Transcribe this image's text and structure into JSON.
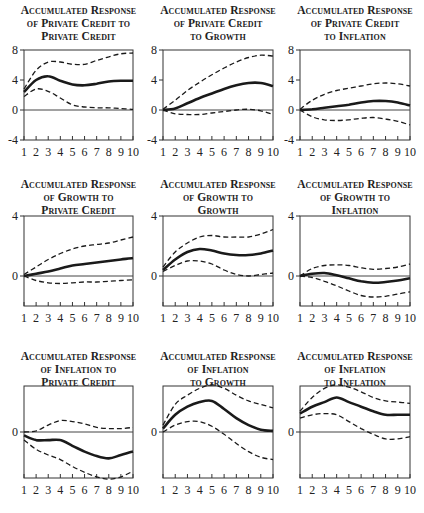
{
  "chart_data": [
    {
      "type": "line",
      "title": "Accumulated Response of Private Credit to Private Credit",
      "title_lines": [
        "Accumulated Response",
        "of Private Credit to",
        "Private Credit"
      ],
      "x": [
        1,
        2,
        3,
        4,
        5,
        6,
        7,
        8,
        9,
        10
      ],
      "xticks": [
        "1",
        "2",
        "3",
        "4",
        "5",
        "6",
        "7",
        "8",
        "9",
        "10"
      ],
      "ylim": [
        -4,
        8
      ],
      "yticks": [
        -4,
        0,
        4,
        8
      ],
      "ytick_labels": [
        "-4",
        "0",
        "4",
        "8"
      ],
      "series": [
        {
          "name": "response",
          "style": "solid",
          "values": [
            2.4,
            4.0,
            4.5,
            3.9,
            3.4,
            3.3,
            3.5,
            3.8,
            3.9,
            3.9
          ]
        },
        {
          "name": "upper band",
          "style": "dashed",
          "values": [
            2.8,
            5.3,
            6.4,
            6.4,
            6.1,
            6.1,
            6.6,
            7.1,
            7.5,
            7.6
          ]
        },
        {
          "name": "lower band",
          "style": "dashed",
          "values": [
            1.8,
            2.8,
            2.5,
            1.6,
            0.7,
            0.4,
            0.3,
            0.3,
            0.2,
            0.1
          ]
        }
      ]
    },
    {
      "type": "line",
      "title": "Accumulated Response of Private Credit to Growth",
      "title_lines": [
        "Accumulated Response",
        "of Private Credit",
        "to Growth"
      ],
      "x": [
        1,
        2,
        3,
        4,
        5,
        6,
        7,
        8,
        9,
        10
      ],
      "xticks": [
        "1",
        "2",
        "3",
        "4",
        "5",
        "6",
        "7",
        "8",
        "9",
        "10"
      ],
      "ylim": [
        -4,
        8
      ],
      "yticks": [
        -4,
        0,
        4,
        8
      ],
      "ytick_labels": [
        "-4",
        "0",
        "4",
        "8"
      ],
      "series": [
        {
          "name": "response",
          "style": "solid",
          "values": [
            0.0,
            0.2,
            0.9,
            1.6,
            2.2,
            2.8,
            3.3,
            3.6,
            3.6,
            3.2
          ]
        },
        {
          "name": "upper band",
          "style": "dashed",
          "values": [
            0.1,
            1.3,
            2.6,
            3.7,
            4.7,
            5.6,
            6.4,
            7.0,
            7.3,
            7.2
          ]
        },
        {
          "name": "lower band",
          "style": "dashed",
          "values": [
            0.0,
            -0.5,
            -0.6,
            -0.6,
            -0.4,
            -0.2,
            0.0,
            0.1,
            -0.1,
            -0.6
          ]
        }
      ]
    },
    {
      "type": "line",
      "title": "Accumulated Response of Private Credit to Inflation",
      "title_lines": [
        "Accumulated Response",
        "of Private Credit",
        "to Inflation"
      ],
      "x": [
        1,
        2,
        3,
        4,
        5,
        6,
        7,
        8,
        9,
        10
      ],
      "xticks": [
        "1",
        "2",
        "3",
        "4",
        "5",
        "6",
        "7",
        "8",
        "9",
        "10"
      ],
      "ylim": [
        -4,
        8
      ],
      "yticks": [
        -4,
        0,
        4,
        8
      ],
      "ytick_labels": [
        "-4",
        "0",
        "4",
        "8"
      ],
      "series": [
        {
          "name": "response",
          "style": "solid",
          "values": [
            0.0,
            0.1,
            0.3,
            0.5,
            0.7,
            1.0,
            1.2,
            1.2,
            1.0,
            0.6
          ]
        },
        {
          "name": "upper band",
          "style": "dashed",
          "values": [
            0.1,
            1.3,
            2.1,
            2.6,
            2.9,
            3.2,
            3.5,
            3.6,
            3.5,
            3.2
          ]
        },
        {
          "name": "lower band",
          "style": "dashed",
          "values": [
            0.0,
            -0.9,
            -1.3,
            -1.4,
            -1.3,
            -1.1,
            -1.0,
            -1.2,
            -1.5,
            -2.0
          ]
        }
      ]
    },
    {
      "type": "line",
      "title": "Accumulated Response of Growth to Private Credit",
      "title_lines": [
        "Accumulated Response",
        "of Growth to",
        "Private Credit"
      ],
      "x": [
        1,
        2,
        3,
        4,
        5,
        6,
        7,
        8,
        9,
        10
      ],
      "xticks": [
        "1",
        "2",
        "3",
        "4",
        "5",
        "6",
        "7",
        "8",
        "9",
        "10"
      ],
      "ylim": [
        -2,
        4
      ],
      "yticks": [
        0,
        4
      ],
      "ytick_labels": [
        "0",
        "4"
      ],
      "series": [
        {
          "name": "response",
          "style": "solid",
          "values": [
            0.0,
            0.15,
            0.3,
            0.5,
            0.7,
            0.8,
            0.9,
            1.0,
            1.1,
            1.2
          ]
        },
        {
          "name": "upper band",
          "style": "dashed",
          "values": [
            0.1,
            0.6,
            1.1,
            1.5,
            1.8,
            2.0,
            2.1,
            2.2,
            2.4,
            2.6
          ]
        },
        {
          "name": "lower band",
          "style": "dashed",
          "values": [
            0.0,
            -0.3,
            -0.45,
            -0.5,
            -0.45,
            -0.4,
            -0.4,
            -0.35,
            -0.3,
            -0.25
          ]
        }
      ]
    },
    {
      "type": "line",
      "title": "Accumulated Response of Growth to Growth",
      "title_lines": [
        "Accumulated Response",
        "of Growth to",
        "Growth"
      ],
      "x": [
        1,
        2,
        3,
        4,
        5,
        6,
        7,
        8,
        9,
        10
      ],
      "xticks": [
        "1",
        "2",
        "3",
        "4",
        "5",
        "6",
        "7",
        "8",
        "9",
        "10"
      ],
      "ylim": [
        -2,
        4
      ],
      "yticks": [
        0,
        4
      ],
      "ytick_labels": [
        "0",
        "4"
      ],
      "series": [
        {
          "name": "response",
          "style": "solid",
          "values": [
            0.4,
            1.1,
            1.6,
            1.8,
            1.7,
            1.5,
            1.4,
            1.4,
            1.5,
            1.7
          ]
        },
        {
          "name": "upper band",
          "style": "dashed",
          "values": [
            0.6,
            1.6,
            2.2,
            2.6,
            2.7,
            2.6,
            2.6,
            2.6,
            2.8,
            3.1
          ]
        },
        {
          "name": "lower band",
          "style": "dashed",
          "values": [
            0.3,
            0.7,
            1.0,
            1.0,
            0.8,
            0.4,
            0.1,
            0.0,
            0.1,
            0.2
          ]
        }
      ]
    },
    {
      "type": "line",
      "title": "Accumulated Response of Growth to Inflation",
      "title_lines": [
        "Accumulated Response",
        "of Growth to",
        "Inflation"
      ],
      "x": [
        1,
        2,
        3,
        4,
        5,
        6,
        7,
        8,
        9,
        10
      ],
      "xticks": [
        "1",
        "2",
        "3",
        "4",
        "5",
        "6",
        "7",
        "8",
        "9",
        "10"
      ],
      "ylim": [
        -2,
        4
      ],
      "yticks": [
        0,
        4
      ],
      "ytick_labels": [
        "0",
        "4"
      ],
      "series": [
        {
          "name": "response",
          "style": "solid",
          "values": [
            0.0,
            0.15,
            0.2,
            0.05,
            -0.15,
            -0.35,
            -0.45,
            -0.4,
            -0.3,
            -0.15
          ]
        },
        {
          "name": "upper band",
          "style": "dashed",
          "values": [
            0.0,
            0.5,
            0.7,
            0.75,
            0.7,
            0.55,
            0.45,
            0.5,
            0.6,
            0.8
          ]
        },
        {
          "name": "lower band",
          "style": "dashed",
          "values": [
            0.0,
            -0.1,
            -0.35,
            -0.65,
            -1.0,
            -1.3,
            -1.4,
            -1.35,
            -1.2,
            -1.05
          ]
        }
      ]
    },
    {
      "type": "line",
      "title": "Accumulated Response of Inflation to Private Credit",
      "title_lines": [
        "Accumulated Response",
        "of Inflation to",
        "Private Credit"
      ],
      "x": [
        1,
        2,
        3,
        4,
        5,
        6,
        7,
        8,
        9,
        10
      ],
      "xticks": [
        "1",
        "2",
        "3",
        "4",
        "5",
        "6",
        "7",
        "8",
        "9",
        "10"
      ],
      "ylim": [
        -2,
        2
      ],
      "yticks": [
        0
      ],
      "ytick_labels": [
        "0"
      ],
      "series": [
        {
          "name": "response",
          "style": "solid",
          "values": [
            -0.15,
            -0.35,
            -0.35,
            -0.35,
            -0.6,
            -0.85,
            -1.05,
            -1.15,
            -1.0,
            -0.85
          ]
        },
        {
          "name": "upper band",
          "style": "dashed",
          "values": [
            0.0,
            0.05,
            0.3,
            0.5,
            0.45,
            0.35,
            0.2,
            0.15,
            0.15,
            0.2
          ]
        },
        {
          "name": "lower band",
          "style": "dashed",
          "values": [
            -0.35,
            -0.75,
            -1.0,
            -1.2,
            -1.5,
            -1.75,
            -1.95,
            -2.05,
            -1.95,
            -1.7
          ]
        }
      ]
    },
    {
      "type": "line",
      "title": "Accumulated Response of Inflation to Growth",
      "title_lines": [
        "Accumulated Response",
        "of Inflation",
        "to Growth"
      ],
      "x": [
        1,
        2,
        3,
        4,
        5,
        6,
        7,
        8,
        9,
        10
      ],
      "xticks": [
        "1",
        "2",
        "3",
        "4",
        "5",
        "6",
        "7",
        "8",
        "9",
        "10"
      ],
      "ylim": [
        -2,
        2
      ],
      "yticks": [
        0
      ],
      "ytick_labels": [
        "0"
      ],
      "series": [
        {
          "name": "response",
          "style": "solid",
          "values": [
            0.15,
            0.75,
            1.1,
            1.3,
            1.35,
            1.0,
            0.6,
            0.3,
            0.1,
            0.05
          ]
        },
        {
          "name": "upper band",
          "style": "dashed",
          "values": [
            0.3,
            1.2,
            1.6,
            1.9,
            2.05,
            1.9,
            1.6,
            1.35,
            1.2,
            1.05
          ]
        },
        {
          "name": "lower band",
          "style": "dashed",
          "values": [
            0.0,
            0.3,
            0.45,
            0.45,
            0.25,
            -0.1,
            -0.5,
            -0.85,
            -1.1,
            -1.2
          ]
        }
      ]
    },
    {
      "type": "line",
      "title": "Accumulated Response of Inflation to Inflation",
      "title_lines": [
        "Accumulated Response",
        "of Inflation",
        "to Inflation"
      ],
      "x": [
        1,
        2,
        3,
        4,
        5,
        6,
        7,
        8,
        9,
        10
      ],
      "xticks": [
        "1",
        "2",
        "3",
        "4",
        "5",
        "6",
        "7",
        "8",
        "9",
        "10"
      ],
      "ylim": [
        -2,
        2
      ],
      "yticks": [
        0
      ],
      "ytick_labels": [
        "0"
      ],
      "series": [
        {
          "name": "response",
          "style": "solid",
          "values": [
            0.8,
            1.1,
            1.3,
            1.5,
            1.3,
            1.1,
            0.9,
            0.75,
            0.75,
            0.75
          ]
        },
        {
          "name": "upper band",
          "style": "dashed",
          "values": [
            0.9,
            1.5,
            1.9,
            2.05,
            1.95,
            1.75,
            1.5,
            1.35,
            1.3,
            1.25
          ]
        },
        {
          "name": "lower band",
          "style": "dashed",
          "values": [
            0.6,
            0.75,
            0.8,
            0.75,
            0.45,
            0.15,
            -0.1,
            -0.3,
            -0.3,
            -0.2
          ]
        }
      ]
    }
  ],
  "layout": {
    "columns_x": [
      [
        24,
        133
      ],
      [
        163,
        273
      ],
      [
        300,
        410
      ]
    ],
    "rows": [
      {
        "title_top": 4,
        "plot_top": 50,
        "plot_bottom": 140,
        "xlabel_y": 156
      },
      {
        "title_top": 178,
        "plot_top": 216,
        "plot_bottom": 306,
        "xlabel_y": 322
      },
      {
        "title_top": 350,
        "plot_top": 386,
        "plot_bottom": 478,
        "xlabel_y": 494
      }
    ]
  }
}
